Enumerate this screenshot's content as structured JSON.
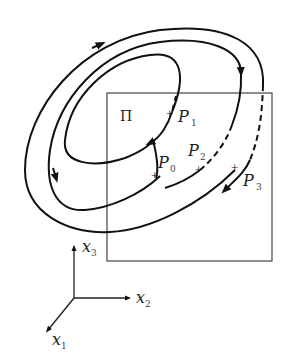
{
  "figure": {
    "type": "poincare-section-diagram",
    "plane": {
      "label": "Π"
    },
    "points": [
      {
        "id": "P0",
        "name": "P",
        "sub": "0"
      },
      {
        "id": "P1",
        "name": "P",
        "sub": "1"
      },
      {
        "id": "P2",
        "name": "P",
        "sub": "2"
      },
      {
        "id": "P3",
        "name": "P",
        "sub": "3"
      }
    ],
    "axes": [
      {
        "id": "x1",
        "name": "x",
        "sub": "1"
      },
      {
        "id": "x2",
        "name": "x",
        "sub": "2"
      },
      {
        "id": "x3",
        "name": "x",
        "sub": "3"
      }
    ],
    "colors": {
      "stroke": "#111111",
      "plane": "#444444",
      "background": "#ffffff"
    }
  }
}
